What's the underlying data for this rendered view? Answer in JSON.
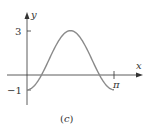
{
  "chart_data": {
    "type": "line",
    "title": "",
    "caption": "(c)",
    "xlabel": "x",
    "ylabel": "y",
    "function": "y = 1 - 2cos(2x)",
    "x_ticks": [
      {
        "value": 3.14159,
        "label": "π"
      }
    ],
    "y_ticks": [
      {
        "value": 3,
        "label": "3"
      },
      {
        "value": -1,
        "label": "-1"
      }
    ],
    "xlim": [
      0,
      3.14159
    ],
    "ylim": [
      -1,
      3
    ],
    "series": [
      {
        "name": "curve",
        "color": "#8a8a8a",
        "x": [
          0,
          0.5236,
          1.5708,
          2.618,
          3.14159
        ],
        "y": [
          -1,
          0,
          3,
          0,
          -1
        ]
      }
    ],
    "grid": false
  },
  "labels": {
    "x_axis": "x",
    "y_axis": "y",
    "pi": "π",
    "three": "3",
    "minus_one": "−1",
    "caption": "(c)"
  }
}
